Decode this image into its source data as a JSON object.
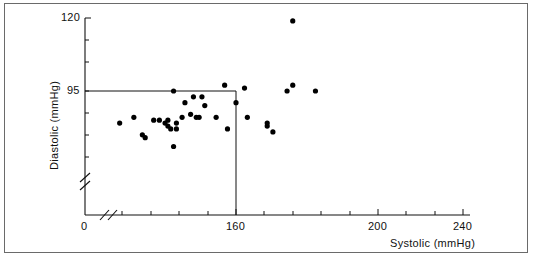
{
  "chart_data": {
    "type": "scatter",
    "title": "",
    "xlabel": "Systolic (mmHg)",
    "ylabel": "Diastolic (mmHg)",
    "xlim": [
      0,
      240
    ],
    "ylim": [
      0,
      120
    ],
    "x_ticks_labeled": [
      "0",
      "160",
      "200",
      "240"
    ],
    "y_ticks_labeled": [
      "95",
      "120"
    ],
    "x_axis_break": true,
    "y_axis_break": true,
    "grid": false,
    "legend": "none",
    "annotations": [
      {
        "name": "threshold-box",
        "x": 160,
        "y": 95,
        "description": "reference lines at systolic 160 and diastolic 95"
      }
    ],
    "points": [
      {
        "x": 119,
        "y": 84
      },
      {
        "x": 124,
        "y": 86
      },
      {
        "x": 127,
        "y": 80
      },
      {
        "x": 128,
        "y": 79
      },
      {
        "x": 131,
        "y": 85
      },
      {
        "x": 133,
        "y": 85
      },
      {
        "x": 135,
        "y": 84
      },
      {
        "x": 136,
        "y": 83
      },
      {
        "x": 136,
        "y": 85
      },
      {
        "x": 137,
        "y": 82
      },
      {
        "x": 138,
        "y": 95
      },
      {
        "x": 138,
        "y": 76
      },
      {
        "x": 139,
        "y": 84
      },
      {
        "x": 139,
        "y": 82
      },
      {
        "x": 141,
        "y": 86
      },
      {
        "x": 142,
        "y": 91
      },
      {
        "x": 144,
        "y": 87
      },
      {
        "x": 145,
        "y": 93
      },
      {
        "x": 146,
        "y": 86
      },
      {
        "x": 147,
        "y": 86
      },
      {
        "x": 148,
        "y": 93
      },
      {
        "x": 149,
        "y": 90
      },
      {
        "x": 153,
        "y": 86
      },
      {
        "x": 156,
        "y": 97
      },
      {
        "x": 157,
        "y": 82
      },
      {
        "x": 160,
        "y": 91
      },
      {
        "x": 163,
        "y": 96
      },
      {
        "x": 164,
        "y": 86
      },
      {
        "x": 171,
        "y": 84
      },
      {
        "x": 171,
        "y": 83
      },
      {
        "x": 173,
        "y": 81
      },
      {
        "x": 180,
        "y": 119
      },
      {
        "x": 180,
        "y": 97
      },
      {
        "x": 178,
        "y": 95
      },
      {
        "x": 188,
        "y": 95
      }
    ]
  },
  "figure": {
    "x_tick_0": "0",
    "x_tick_160": "160",
    "x_tick_200": "200",
    "x_tick_240": "240",
    "y_tick_95": "95",
    "y_tick_120": "120",
    "x_axis_title": "Systolic (mmHg)",
    "y_axis_title": "Diastolic (mmHg)"
  }
}
